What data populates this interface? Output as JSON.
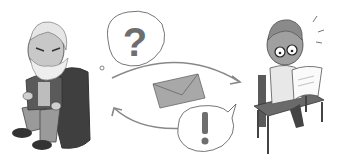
{
  "illustration": {
    "description": "Old man in armchair and young man at desk exchanging a letter",
    "left_figure": "elderly bearded man seated in armchair",
    "right_figure": "young man with glasses reading a letter at desk",
    "thought_bubble_symbol": "?",
    "speech_bubble_symbol": "!",
    "center_object": "envelope",
    "colors": {
      "background": "#ffffff",
      "outline": "#555555",
      "gray_light": "#d4d4d4",
      "gray_mid": "#a8a8a8",
      "gray_dark": "#5a5a5a",
      "symbol": "#6e6e6e"
    }
  }
}
